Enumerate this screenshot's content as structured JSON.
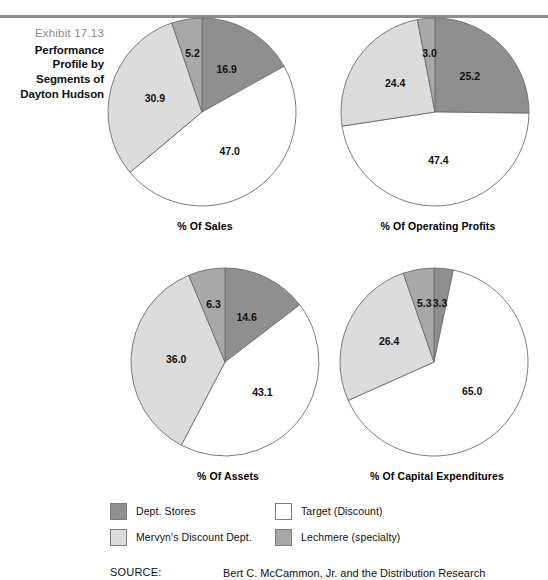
{
  "exhibit": {
    "number": "Exhibit 17.13",
    "title_line1": "Performance",
    "title_line2": "Profile by",
    "title_line3": "Segments of",
    "title_line4": "Dayton Hudson"
  },
  "colors": {
    "dept_stores": "#8f8f8f",
    "mervyns": "#dcdcdc",
    "target": "#ffffff",
    "lechmere": "#a8a8a8",
    "outline": "#6e6e6e",
    "rule": "#8d8d8d",
    "exhibit_number": "#8a8a8a"
  },
  "legend": {
    "items": [
      {
        "label": "Dept. Stores",
        "swatch": "dept_stores",
        "column": "left"
      },
      {
        "label": "Mervyn's Discount Dept.",
        "swatch": "mervyns",
        "column": "left"
      },
      {
        "label": "Target (Discount)",
        "swatch": "target",
        "column": "right"
      },
      {
        "label": "Lechmere (specialty)",
        "swatch": "lechmere",
        "column": "right"
      }
    ]
  },
  "source": {
    "label": "SOURCE:",
    "text": "Bert C. McCammon, Jr. and the Distribution Research"
  },
  "chart_data": [
    {
      "type": "pie",
      "title": "% Of Sales",
      "categories": [
        "Dept. Stores",
        "Target (Discount)",
        "Mervyn's Discount Dept.",
        "Lechmere (specialty)"
      ],
      "values": [
        16.9,
        47.0,
        30.9,
        5.2
      ],
      "labels": [
        "16.9",
        "47.0",
        "30.9",
        "5.2"
      ],
      "colors": [
        "#8f8f8f",
        "#ffffff",
        "#dcdcdc",
        "#a8a8a8"
      ],
      "start_angle_deg": 0,
      "direction": "clockwise",
      "legend_position": "bottom"
    },
    {
      "type": "pie",
      "title": "% Of Operating Profits",
      "categories": [
        "Dept. Stores",
        "Target (Discount)",
        "Mervyn's Discount Dept.",
        "Lechmere (specialty)"
      ],
      "values": [
        25.2,
        47.4,
        24.4,
        3.0
      ],
      "labels": [
        "25.2",
        "47.4",
        "24.4",
        "3.0"
      ],
      "colors": [
        "#8f8f8f",
        "#ffffff",
        "#dcdcdc",
        "#a8a8a8"
      ],
      "start_angle_deg": 0,
      "direction": "clockwise",
      "legend_position": "bottom"
    },
    {
      "type": "pie",
      "title": "% Of Assets",
      "categories": [
        "Dept. Stores",
        "Target (Discount)",
        "Mervyn's Discount Dept.",
        "Lechmere (specialty)"
      ],
      "values": [
        14.6,
        43.1,
        36.0,
        6.3
      ],
      "labels": [
        "14.6",
        "43.1",
        "36.0",
        "6.3"
      ],
      "colors": [
        "#8f8f8f",
        "#ffffff",
        "#dcdcdc",
        "#a8a8a8"
      ],
      "start_angle_deg": 0,
      "direction": "clockwise",
      "legend_position": "bottom"
    },
    {
      "type": "pie",
      "title": "% Of Capital Expenditures",
      "categories": [
        "Dept. Stores",
        "Target (Discount)",
        "Mervyn's Discount Dept.",
        "Lechmere (specialty)"
      ],
      "values": [
        3.3,
        65.0,
        26.4,
        5.3
      ],
      "labels": [
        "3.3",
        "65.0",
        "26.4",
        "5.3"
      ],
      "colors": [
        "#8f8f8f",
        "#ffffff",
        "#dcdcdc",
        "#a8a8a8"
      ],
      "start_angle_deg": 0,
      "direction": "clockwise",
      "legend_position": "bottom"
    }
  ]
}
